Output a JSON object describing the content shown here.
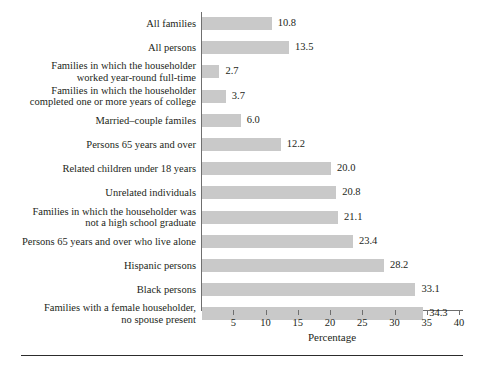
{
  "chart_data": {
    "type": "bar",
    "orientation": "horizontal",
    "title": "",
    "subtitle": "",
    "xlabel": "Percentage",
    "ylabel": "",
    "xlim": [
      0,
      41
    ],
    "grid": false,
    "legend": null,
    "bar_color": "#c9c9c9",
    "axis_color": "#6f6f6f",
    "text_color": "#231f20",
    "xticks": [
      5,
      10,
      15,
      20,
      25,
      30,
      35,
      40
    ],
    "xtick_labels": [
      "5",
      "10",
      "15",
      "20",
      "25",
      "30",
      "35",
      "40"
    ],
    "categories": [
      "All families",
      "All persons",
      "Families in which the householder\nworked year-round full-time",
      "Families in which the householder\ncompleted one or more years of college",
      "Married–couple familes",
      "Persons 65 years and over",
      "Related children under 18 years",
      "Unrelated individuals",
      "Families in which the householder was\nnot a high school graduate",
      "Persons 65 years and over who live alone",
      "Hispanic persons",
      "Black persons",
      "Families with a female householder,\nno spouse present"
    ],
    "values": [
      10.8,
      13.5,
      2.7,
      3.7,
      6.0,
      12.2,
      20.0,
      20.8,
      21.1,
      23.4,
      28.2,
      33.1,
      34.3
    ],
    "value_labels": [
      "10.8",
      "13.5",
      "2.7",
      "3.7",
      "6.0",
      "12.2",
      "20.0",
      "20.8",
      "21.1",
      "23.4",
      "28.2",
      "33.1",
      "34.3"
    ]
  }
}
